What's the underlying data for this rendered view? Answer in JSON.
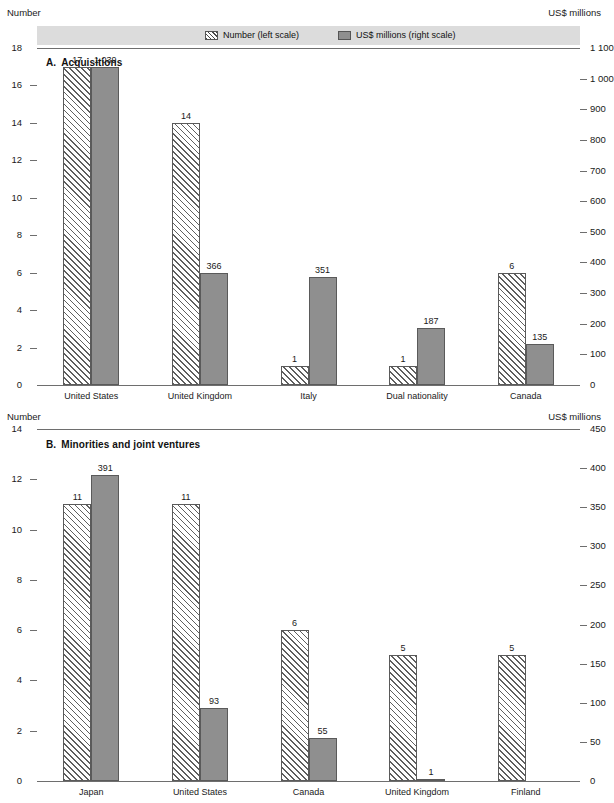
{
  "legend": {
    "items": [
      {
        "swatch": "hatch-swatch",
        "label": "Number (left scale)"
      },
      {
        "swatch": "solid-swatch",
        "label": "US$ millions (right scale)"
      }
    ]
  },
  "panel_a": {
    "letter": "A.",
    "title": "Acquisitions",
    "left_axis_title": "Number",
    "right_axis_title": "US$ millions",
    "left_ticks": [
      "18",
      "16",
      "14",
      "12",
      "10",
      "8",
      "6",
      "4",
      "2",
      "0"
    ],
    "right_ticks": [
      "1 100",
      "1 000",
      "900",
      "800",
      "700",
      "600",
      "500",
      "400",
      "300",
      "200",
      "100",
      "0"
    ],
    "categories": [
      "United States",
      "United Kingdom",
      "Italy",
      "Dual nationality",
      "Canada"
    ],
    "number_labels": [
      "17",
      "14",
      "1",
      "1",
      "6"
    ],
    "usd_labels": [
      "1 039",
      "366",
      "351",
      "187",
      "135"
    ]
  },
  "panel_b": {
    "letter": "B.",
    "title": "Minorities and joint ventures",
    "left_axis_title": "Number",
    "right_axis_title": "US$ millions",
    "left_ticks": [
      "14",
      "12",
      "10",
      "8",
      "6",
      "4",
      "2",
      "0"
    ],
    "right_ticks": [
      "450",
      "400",
      "350",
      "300",
      "250",
      "200",
      "150",
      "100",
      "50",
      "0"
    ],
    "categories": [
      "Japan",
      "United States",
      "Canada",
      "United Kingdom",
      "Finland"
    ],
    "number_labels": [
      "11",
      "11",
      "6",
      "5",
      "5"
    ],
    "usd_labels": [
      "391",
      "93",
      "55",
      "1",
      ""
    ]
  },
  "chart_data": [
    {
      "type": "bar",
      "title": "A. Acquisitions",
      "categories": [
        "United States",
        "United Kingdom",
        "Italy",
        "Dual nationality",
        "Canada"
      ],
      "series": [
        {
          "name": "Number (left scale)",
          "axis": "left",
          "values": [
            17,
            14,
            1,
            1,
            6
          ]
        },
        {
          "name": "US$ millions (right scale)",
          "axis": "right",
          "values": [
            1039,
            366,
            351,
            187,
            135
          ]
        }
      ],
      "xlabel": "",
      "ylabel": "Number",
      "y2label": "US$ millions",
      "ylim": [
        0,
        18
      ],
      "y2lim": [
        0,
        1100
      ],
      "ytick_step": 2,
      "y2tick_step": 100,
      "grid": false,
      "legend": "top"
    },
    {
      "type": "bar",
      "title": "B. Minorities and joint ventures",
      "categories": [
        "Japan",
        "United States",
        "Canada",
        "United Kingdom",
        "Finland"
      ],
      "series": [
        {
          "name": "Number (left scale)",
          "axis": "left",
          "values": [
            11,
            11,
            6,
            5,
            5
          ]
        },
        {
          "name": "US$ millions (right scale)",
          "axis": "right",
          "values": [
            391,
            93,
            55,
            1,
            0
          ]
        }
      ],
      "xlabel": "",
      "ylabel": "Number",
      "y2label": "US$ millions",
      "ylim": [
        0,
        14
      ],
      "y2lim": [
        0,
        450
      ],
      "ytick_step": 2,
      "y2tick_step": 50,
      "grid": false,
      "legend": "top"
    }
  ]
}
